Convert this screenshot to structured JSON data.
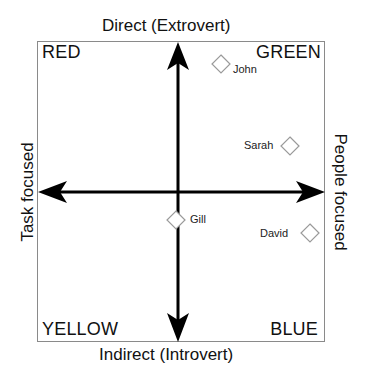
{
  "axes": {
    "top": "Direct (Extrovert)",
    "bottom": "Indirect (Introvert)",
    "left": "Task focused",
    "right": "People focused"
  },
  "quadrants": {
    "top_left": "RED",
    "top_right": "GREEN",
    "bottom_left": "YELLOW",
    "bottom_right": "BLUE"
  },
  "people": [
    {
      "name": "John",
      "x": 221,
      "y": 64
    },
    {
      "name": "Sarah",
      "x": 290,
      "y": 146
    },
    {
      "name": "Gill",
      "x": 176,
      "y": 220
    },
    {
      "name": "David",
      "x": 310,
      "y": 233
    }
  ],
  "colors": {
    "axis": "#000000",
    "frame": "#8a8a8a",
    "marker": "#9a9a9a"
  }
}
